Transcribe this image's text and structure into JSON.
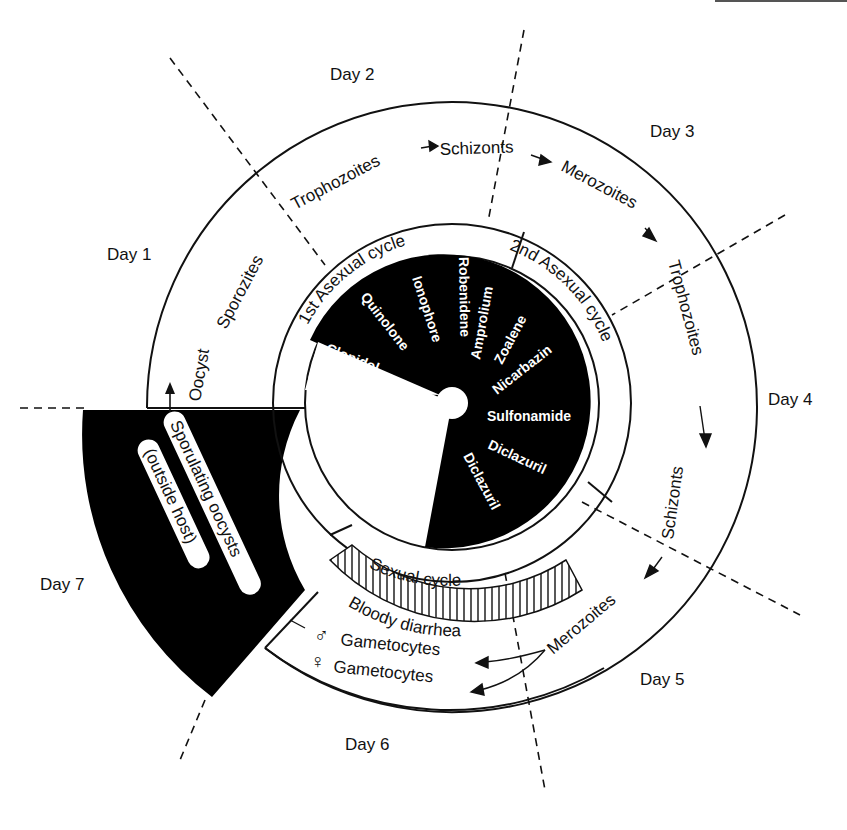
{
  "days": {
    "day1": "Day 1",
    "day2": "Day 2",
    "day3": "Day 3",
    "day4": "Day 4",
    "day5": "Day 5",
    "day6": "Day 6",
    "day7": "Day 7"
  },
  "outer_ring": {
    "stages": {
      "oocyst": "Oocyst",
      "sporozites": "Sporozites",
      "trophozoites_1": "Trophozoites",
      "schizonts_1": "Schizonts",
      "merozoites_1": "Merozoites",
      "trophozoites_2": "Trophozoites",
      "schizonts_2": "Schizonts",
      "merozoites_2": "Merozoites",
      "male_gametocytes": "Gametocytes",
      "female_gametocytes": "Gametocytes"
    },
    "symbols": {
      "male": "♂",
      "female": "♀"
    }
  },
  "middle_ring": {
    "first_asexual": "1st Asexual cycle",
    "second_asexual": "2nd Asexual cycle",
    "sexual": "Sexual cycle",
    "bloody_diarrhea": "Bloody diarrhea"
  },
  "outside_host": {
    "line1": "Sporulating oocysts",
    "line2": "(outside host)"
  },
  "drugs": [
    "Clopidol",
    "Quinolone",
    "Ionophore",
    "Robenidene",
    "Amprolium",
    "Zoalene",
    "Nicarbazin",
    "Sulfonamide",
    "Diclazuril",
    "Diclazuril"
  ],
  "colors": {
    "ink": "#111111",
    "paper": "#ffffff"
  }
}
